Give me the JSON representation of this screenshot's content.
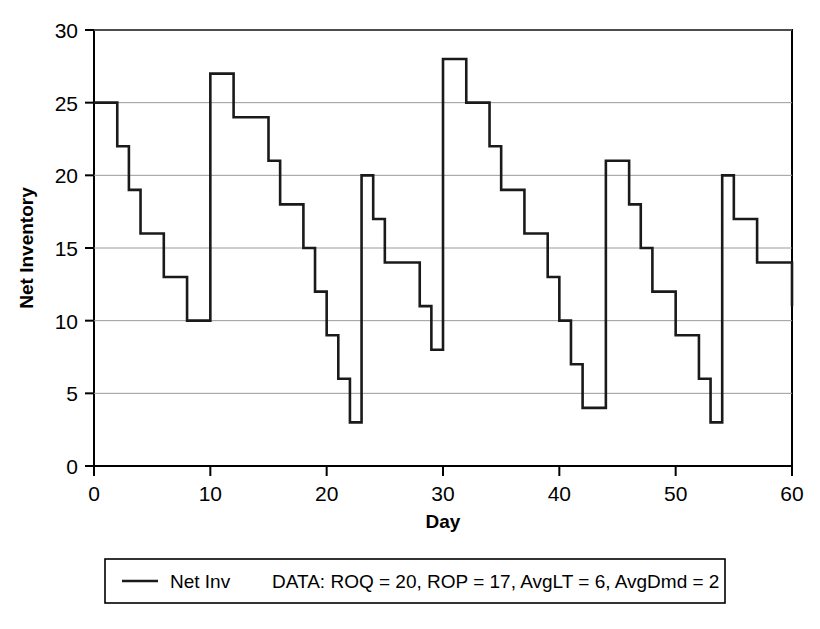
{
  "chart_data": {
    "type": "line",
    "subtype": "step-post",
    "title": "",
    "xlabel": "Day",
    "ylabel": "Net Inventory",
    "xlim": [
      0,
      60
    ],
    "ylim": [
      0,
      30
    ],
    "xticks": [
      0,
      10,
      20,
      30,
      40,
      50,
      60
    ],
    "yticks": [
      0,
      5,
      10,
      15,
      20,
      25,
      30
    ],
    "grid": "horizontal",
    "legend_position": "below-plot",
    "series": [
      {
        "name": "Net Inv",
        "x": [
          0,
          2,
          3,
          4,
          6,
          8,
          10,
          10,
          12,
          15,
          16,
          18,
          19,
          20,
          21,
          22,
          23,
          23,
          24,
          25,
          27,
          28,
          29,
          30,
          30,
          32,
          34,
          35,
          37,
          39,
          40,
          41,
          42,
          44,
          44,
          46,
          47,
          48,
          50,
          51,
          52,
          53,
          54,
          54,
          55,
          57,
          59,
          60
        ],
        "y": [
          25,
          22,
          19,
          16,
          13,
          10,
          10,
          27,
          24,
          21,
          18,
          15,
          12,
          9,
          6,
          3,
          3,
          20,
          17,
          14,
          14,
          11,
          8,
          8,
          28,
          25,
          22,
          19,
          16,
          13,
          10,
          7,
          4,
          4,
          21,
          18,
          15,
          12,
          9,
          9,
          6,
          3,
          3,
          20,
          17,
          14,
          14,
          11
        ]
      }
    ],
    "parameters": {
      "ROQ": 20,
      "ROP": 17,
      "AvgLT": 6,
      "AvgDmd": 2
    }
  },
  "axes": {
    "y_label": "Net Inventory",
    "x_label": "Day",
    "y_tick_labels": [
      "30",
      "25",
      "20",
      "15",
      "10",
      "5",
      "0"
    ],
    "x_tick_labels": [
      "0",
      "10",
      "20",
      "30",
      "40",
      "50",
      "60"
    ]
  },
  "legend": {
    "series_label": "Net Inv",
    "data_note": "DATA: ROQ = 20, ROP = 17, AvgLT = 6, AvgDmd = 2",
    "marker": "line-swatch"
  },
  "colors": {
    "series": "#1a1a1a",
    "axis": "#000000",
    "grid": "#9a9a9a",
    "background": "#ffffff"
  }
}
